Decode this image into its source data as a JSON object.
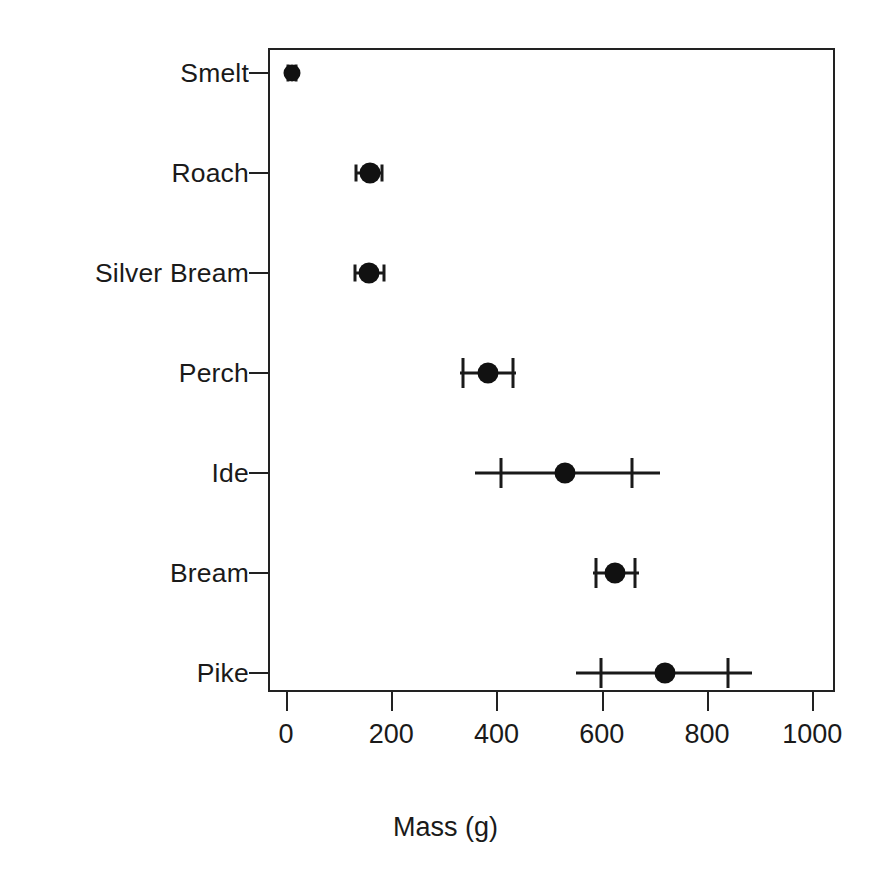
{
  "chart_data": {
    "type": "scatter",
    "orientation": "horizontal",
    "title": "",
    "xlabel": "Mass (g)",
    "ylabel": "",
    "xlim": [
      -30,
      1045
    ],
    "grid": false,
    "legend": null,
    "xticks": [
      0,
      200,
      400,
      600,
      800,
      1000
    ],
    "xtick_labels": [
      "0",
      "200",
      "400",
      "600",
      "800",
      "1000"
    ],
    "categories": [
      "Smelt",
      "Roach",
      "Silver Bream",
      "Perch",
      "Ide",
      "Bream",
      "Pike"
    ],
    "series": [
      {
        "name": "Mean mass with confidence interval",
        "points": [
          {
            "category": "Smelt",
            "value": 11,
            "cap_low": 3,
            "cap_high": 19,
            "line_low": 3,
            "line_high": 19,
            "cap_style": "small",
            "point_style": "small"
          },
          {
            "category": "Roach",
            "value": 160,
            "cap_low": 133,
            "cap_high": 183,
            "line_low": 133,
            "line_high": 183,
            "cap_style": "small",
            "point_style": "normal"
          },
          {
            "category": "Silver Bream",
            "value": 158,
            "cap_low": 131,
            "cap_high": 186,
            "line_low": 131,
            "line_high": 186,
            "cap_style": "small",
            "point_style": "normal"
          },
          {
            "category": "Perch",
            "value": 384,
            "cap_low": 337,
            "cap_high": 431,
            "line_low": 330,
            "line_high": 438,
            "cap_style": "normal",
            "point_style": "normal"
          },
          {
            "category": "Ide",
            "value": 530,
            "cap_low": 409,
            "cap_high": 658,
            "line_low": 359,
            "line_high": 711,
            "cap_style": "normal",
            "point_style": "normal"
          },
          {
            "category": "Bream",
            "value": 626,
            "cap_low": 589,
            "cap_high": 663,
            "line_low": 583,
            "line_high": 671,
            "cap_style": "normal",
            "point_style": "normal"
          },
          {
            "category": "Pike",
            "value": 720,
            "cap_low": 599,
            "cap_high": 840,
            "line_low": 551,
            "line_high": 886,
            "cap_style": "normal",
            "point_style": "normal"
          }
        ]
      }
    ]
  },
  "style": {
    "marker_color": "#111111",
    "axis_color": "#222222",
    "text_color": "#1a1a1a",
    "background": "#ffffff"
  }
}
